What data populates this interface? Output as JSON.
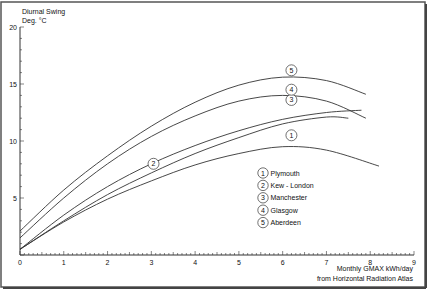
{
  "chart_data": {
    "type": "line",
    "title": "",
    "ylabel": "Diurnal Swing\nDeg. °C",
    "ylabel_lines": [
      "Diurnal Swing",
      "Deg. °C"
    ],
    "xlabel": "Monthly GMAX kWh/day\nfrom Horizontal Radiation Atlas",
    "xlabel_lines": [
      "Monthly GMAX kWh/day",
      "from Horizontal Radiation Atlas"
    ],
    "xlim": [
      0,
      9
    ],
    "ylim": [
      0,
      20
    ],
    "x_ticks": [
      "0",
      "1",
      "2",
      "3",
      "4",
      "5",
      "6",
      "7",
      "8",
      "9"
    ],
    "y_ticks": [
      "5",
      "10",
      "15",
      "20"
    ],
    "grid": false,
    "legend_position": "lower-right inside",
    "series": [
      {
        "id": "1",
        "name": "Plymouth",
        "x": [
          0,
          1,
          2,
          3,
          4,
          5,
          6,
          7,
          8.2
        ],
        "y": [
          0.5,
          2.9,
          4.9,
          6.5,
          7.9,
          8.9,
          9.5,
          9.2,
          7.8
        ],
        "label_at": [
          6.2,
          10.5
        ]
      },
      {
        "id": "2",
        "name": "Kew - London",
        "x": [
          0,
          1,
          2,
          3,
          4,
          5,
          6,
          7,
          7.8
        ],
        "y": [
          0.5,
          3.5,
          6.0,
          8.0,
          9.6,
          10.9,
          11.9,
          12.5,
          12.7
        ],
        "label_at": [
          3.05,
          8.0
        ]
      },
      {
        "id": "3",
        "name": "Manchester",
        "x": [
          0,
          1,
          2,
          3,
          4,
          5,
          6,
          7,
          7.5
        ],
        "y": [
          0.5,
          3.0,
          5.3,
          7.2,
          8.9,
          10.3,
          11.5,
          12.1,
          12.0
        ],
        "label_at": [
          6.2,
          13.6
        ]
      },
      {
        "id": "4",
        "name": "Glasgow",
        "x": [
          0,
          1,
          2,
          3,
          4,
          5,
          6,
          7,
          7.9
        ],
        "y": [
          1.5,
          5.0,
          8.0,
          10.4,
          12.2,
          13.5,
          14.0,
          13.5,
          12.0
        ],
        "label_at": [
          6.2,
          14.5
        ]
      },
      {
        "id": "5",
        "name": "Aberdeen",
        "x": [
          0,
          1,
          2,
          3,
          4,
          5,
          6,
          7,
          7.9
        ],
        "y": [
          2.1,
          5.7,
          8.7,
          11.3,
          13.4,
          14.9,
          15.6,
          15.3,
          14.1
        ],
        "label_at": [
          6.2,
          16.2
        ]
      }
    ]
  },
  "legend": {
    "items": [
      {
        "num": "1",
        "label": "Plymouth"
      },
      {
        "num": "2",
        "label": "Kew - London"
      },
      {
        "num": "3",
        "label": "Manchester"
      },
      {
        "num": "4",
        "label": "Glasgow"
      },
      {
        "num": "5",
        "label": "Aberdeen"
      }
    ]
  },
  "colors": {
    "line": "#333333",
    "axis": "#333333",
    "frame": "#666666",
    "background": "#ffffff"
  }
}
